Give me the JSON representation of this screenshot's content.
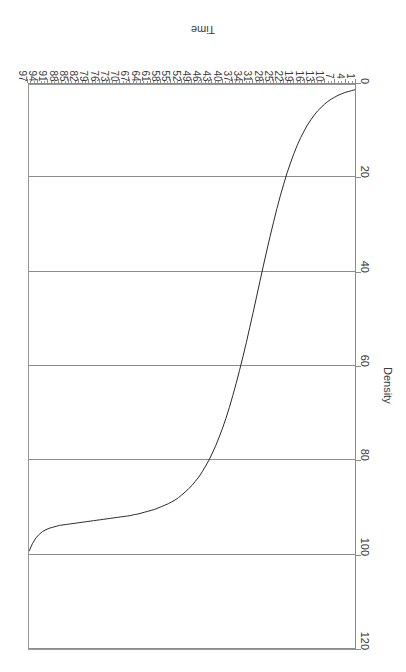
{
  "chart_data": {
    "type": "line",
    "title": "",
    "subtitle": "",
    "xlabel": "Time",
    "ylabel": "Density",
    "xlim": [
      1,
      97
    ],
    "ylim": [
      0,
      120
    ],
    "grid": "horizontal-on-density-ticks",
    "legend": "none",
    "orientation_note": "rendered rotated 180 degrees",
    "x_tick_labels": [
      "1",
      "4",
      "7",
      "10",
      "13",
      "16",
      "19",
      "22",
      "25",
      "28",
      "31",
      "34",
      "37",
      "40",
      "43",
      "46",
      "49",
      "52",
      "55",
      "58",
      "61",
      "64",
      "67",
      "70",
      "73",
      "76",
      "79",
      "82",
      "85",
      "88",
      "91",
      "94",
      "97"
    ],
    "x_tick_values": [
      1,
      4,
      7,
      10,
      13,
      16,
      19,
      22,
      25,
      28,
      31,
      34,
      37,
      40,
      43,
      46,
      49,
      52,
      55,
      58,
      61,
      64,
      67,
      70,
      73,
      76,
      79,
      82,
      85,
      88,
      91,
      94,
      97
    ],
    "x_minor_tick_step": 1,
    "y_tick_labels": [
      "0",
      "20",
      "40",
      "60",
      "80",
      "100",
      "120"
    ],
    "y_tick_values": [
      0,
      20,
      40,
      60,
      80,
      100,
      120
    ],
    "series": [
      {
        "name": "Density",
        "color": "#2b2b2b",
        "x": [
          1,
          2,
          3,
          4,
          5,
          6,
          7,
          8,
          9,
          10,
          11,
          12,
          13,
          14,
          15,
          16,
          17,
          18,
          19,
          20,
          21,
          22,
          23,
          24,
          25,
          26,
          27,
          28,
          29,
          30,
          31,
          32,
          33,
          34,
          35,
          36,
          37,
          38,
          39,
          40,
          41,
          42,
          43,
          44,
          45,
          46,
          47,
          48,
          49,
          50,
          51,
          52,
          53,
          54,
          55,
          56,
          57,
          58,
          59,
          60,
          61,
          62,
          63,
          64,
          65,
          66,
          67,
          68,
          69,
          70,
          71,
          72,
          73,
          74,
          75,
          76,
          77,
          78,
          79,
          80,
          81,
          82,
          83,
          84,
          85,
          86,
          87,
          88,
          89,
          90,
          91,
          92,
          93,
          94,
          95,
          96,
          97
        ],
        "values": [
          1.0,
          1.2,
          1.4,
          1.6,
          1.9,
          2.2,
          2.6,
          3.0,
          3.5,
          4.1,
          4.8,
          5.5,
          6.4,
          7.4,
          8.5,
          9.8,
          11.2,
          12.8,
          14.6,
          16.6,
          18.7,
          21.1,
          23.6,
          26.3,
          29.2,
          32.2,
          35.3,
          38.5,
          41.8,
          45.1,
          48.4,
          51.6,
          54.8,
          57.8,
          60.7,
          63.5,
          66.1,
          68.6,
          70.9,
          73.0,
          74.9,
          76.7,
          78.3,
          79.8,
          81.1,
          82.3,
          83.4,
          84.3,
          85.2,
          85.9,
          86.6,
          87.2,
          87.8,
          88.3,
          88.7,
          89.1,
          89.4,
          89.7,
          90.0,
          90.3,
          90.5,
          90.7,
          90.9,
          91.1,
          91.3,
          91.4,
          91.6,
          91.7,
          91.8,
          91.9,
          92.0,
          92.1,
          92.2,
          92.3,
          92.4,
          92.5,
          92.6,
          92.7,
          92.8,
          92.9,
          93.0,
          93.1,
          93.2,
          93.3,
          93.4,
          93.5,
          93.6,
          93.7,
          93.9,
          94.1,
          94.3,
          94.6,
          95.0,
          95.6,
          96.4,
          97.6,
          99.2
        ]
      }
    ]
  },
  "axes": {
    "x_title": "Time",
    "y_title": "Density"
  }
}
